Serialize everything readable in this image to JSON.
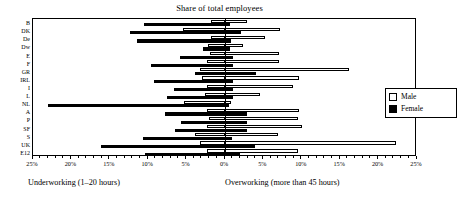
{
  "chart_data": {
    "type": "bar",
    "orientation": "horizontal-diverging",
    "title": "Share of total employees",
    "xlabel": "",
    "ylabel": "",
    "left_label": "Underworking (1–20 hours)",
    "right_label": "Overworking (more than 45 hours)",
    "axis_max_percent": 25,
    "tick_labels": [
      "25%",
      "20%",
      "15%",
      "10%",
      "5%",
      "0%",
      "5%",
      "10%",
      "15%",
      "20%",
      "25%"
    ],
    "tick_values": [
      -25,
      -20,
      -15,
      -10,
      -5,
      0,
      5,
      10,
      15,
      20,
      25
    ],
    "grid": false,
    "legend_position": "right-inside",
    "legend": [
      {
        "name": "Male",
        "fill": "#ffffff",
        "stroke": "#000000"
      },
      {
        "name": "Female",
        "fill": "#000000",
        "stroke": "#000000"
      }
    ],
    "categories": [
      "B",
      "DK",
      "De",
      "Dw",
      "E",
      "F",
      "GR",
      "IRL",
      "I",
      "L",
      "NL",
      "A",
      "P",
      "SF",
      "S",
      "UK",
      "E12"
    ],
    "series": [
      {
        "name": "Male",
        "underworking": [
          1.8,
          5.5,
          1.8,
          2.2,
          1.9,
          2.3,
          3.3,
          3.0,
          2.4,
          2.6,
          5.3,
          2.4,
          2.1,
          2.3,
          3.9,
          3.2,
          2.4
        ],
        "overworking": [
          2.9,
          7.1,
          5.2,
          2.4,
          7.0,
          7.0,
          16.2,
          9.7,
          8.8,
          4.5,
          0.8,
          9.6,
          9.5,
          10.0,
          6.9,
          22.3,
          9.5
        ]
      },
      {
        "name": "Female",
        "underworking": [
          10.5,
          12.4,
          11.4,
          2.8,
          5.9,
          9.7,
          3.9,
          9.3,
          6.6,
          7.5,
          23.0,
          7.8,
          5.7,
          6.5,
          10.7,
          16.1,
          10.4
        ],
        "overworking": [
          0.7,
          2.1,
          0.8,
          0.7,
          1.0,
          1.0,
          4.1,
          1.0,
          1.0,
          1.0,
          0.5,
          2.9,
          2.9,
          2.9,
          0.9,
          3.9,
          2.0
        ]
      }
    ]
  }
}
